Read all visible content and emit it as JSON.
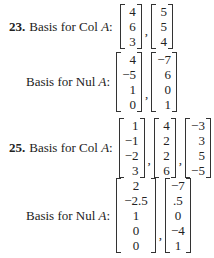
{
  "problems": [
    {
      "number": "23.",
      "col": {
        "label": "Basis for Col ",
        "var": "A",
        "colon": ":",
        "vectors": [
          [
            "4",
            "6",
            "3"
          ],
          [
            "5",
            "5",
            "4"
          ]
        ]
      },
      "nul": {
        "label": "Basis for Nul ",
        "var": "A",
        "colon": ":",
        "vectors": [
          [
            "4",
            "−5",
            "1",
            "0"
          ],
          [
            "−7",
            "6",
            "0",
            "1"
          ]
        ]
      }
    },
    {
      "number": "25.",
      "col": {
        "label": "Basis for Col ",
        "var": "A",
        "colon": ":",
        "vectors": [
          [
            "1",
            "−1",
            "−2",
            "3"
          ],
          [
            "4",
            "2",
            "2",
            "6"
          ],
          [
            "−3",
            "3",
            "5",
            "−5"
          ]
        ]
      },
      "nul": {
        "label": "Basis for Nul ",
        "var": "A",
        "colon": ":",
        "vectors": [
          [
            "2",
            "−2.5",
            "1",
            "0",
            "0"
          ],
          [
            "−7",
            ".5",
            "0",
            "−4",
            "1"
          ]
        ]
      }
    }
  ],
  "separator": ","
}
